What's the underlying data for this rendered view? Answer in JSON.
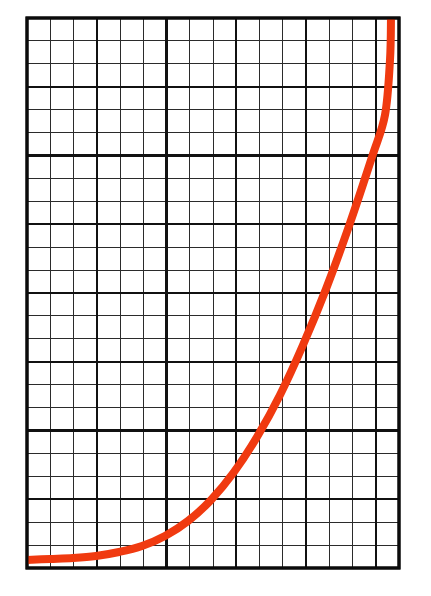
{
  "figure": {
    "title": "",
    "caption": "",
    "background_color": "#ffffff",
    "type": "hand-drawn graph on grid paper"
  },
  "grid": {
    "name": "graph-paper-grid",
    "left": 27,
    "top": 18,
    "right": 399,
    "bottom": 568,
    "width": 372,
    "height": 550,
    "columns": 16,
    "rows": 24,
    "cell_width": 23.25,
    "cell_height": 22.92,
    "major_every_columns": 3,
    "major_every_rows": 3,
    "minor_line_color": "#2b2b2b",
    "minor_line_width": 1,
    "major_line_color": "#111111",
    "major_line_width": 2.4,
    "border_color": "#0b0b0b",
    "border_width": 3,
    "cell_fill": "#ffffff"
  },
  "chart_data": {
    "type": "line",
    "title": "",
    "subtitle": "",
    "xlabel": "",
    "ylabel": "",
    "xlim": [
      0,
      16
    ],
    "ylim": [
      0,
      24
    ],
    "grid": true,
    "legend": null,
    "legend_position": "none",
    "annotations": [],
    "xticks": [
      0,
      3,
      6,
      9,
      12,
      15
    ],
    "yticks": [
      0,
      3,
      6,
      9,
      12,
      15,
      18,
      21,
      24
    ],
    "xtick_labels": [],
    "ytick_labels": [],
    "series": [
      {
        "name": "exponential-curve",
        "color": "#F03A10",
        "line_width": 8,
        "style": "solid",
        "markers": false,
        "x": [
          0,
          1,
          2,
          3,
          4,
          5,
          6,
          7,
          8,
          9,
          10,
          11,
          12,
          13,
          14,
          15,
          15.4
        ],
        "y": [
          0.35,
          0.4,
          0.5,
          0.7,
          1.0,
          1.5,
          2.2,
          3.2,
          4.6,
          6.4,
          8.6,
          11.2,
          14.2,
          17.4,
          20.8,
          23.8,
          24.0
        ]
      }
    ],
    "points_px": [
      {
        "x": 27,
        "y": 560
      },
      {
        "x": 50,
        "y": 559
      },
      {
        "x": 73,
        "y": 558
      },
      {
        "x": 96,
        "y": 556
      },
      {
        "x": 119,
        "y": 552
      },
      {
        "x": 142,
        "y": 546
      },
      {
        "x": 165,
        "y": 536
      },
      {
        "x": 188,
        "y": 521
      },
      {
        "x": 211,
        "y": 500
      },
      {
        "x": 234,
        "y": 472
      },
      {
        "x": 257,
        "y": 437
      },
      {
        "x": 280,
        "y": 395
      },
      {
        "x": 303,
        "y": 345
      },
      {
        "x": 326,
        "y": 289
      },
      {
        "x": 349,
        "y": 226
      },
      {
        "x": 372,
        "y": 157
      },
      {
        "x": 385,
        "y": 115
      },
      {
        "x": 390,
        "y": 60
      },
      {
        "x": 391,
        "y": 18
      }
    ]
  },
  "colors": {
    "curve": "#F03A10",
    "curve_highlight": "#FF5722",
    "grid_major": "#111111",
    "grid_minor": "#2b2b2b",
    "border": "#0b0b0b",
    "paper": "#ffffff"
  }
}
